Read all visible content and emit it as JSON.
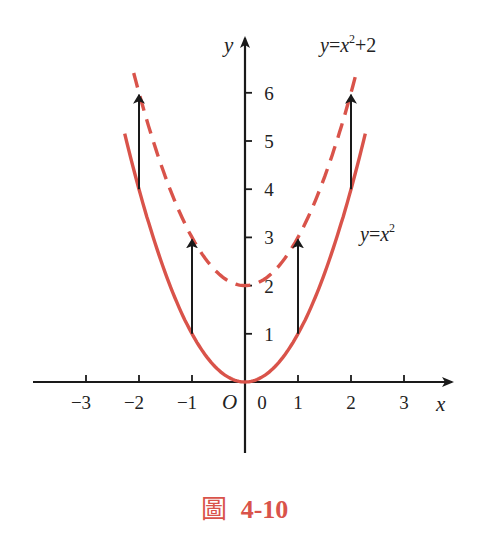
{
  "chart_data": {
    "type": "line",
    "title": "",
    "caption": {
      "prefix": "圖",
      "number": "4-10"
    },
    "xlabel": "x",
    "ylabel": "y",
    "origin_label": "O",
    "xlim": [
      -3.8,
      3.8
    ],
    "ylim": [
      -1.5,
      7
    ],
    "grid": false,
    "x_ticks": [
      -3,
      -2,
      -1,
      0,
      1,
      2,
      3
    ],
    "x_tick_labels": [
      "−3",
      "−2",
      "−1",
      "0",
      "1",
      "2",
      "3"
    ],
    "y_ticks": [
      1,
      2,
      3,
      4,
      5,
      6
    ],
    "y_tick_labels": [
      "1",
      "2",
      "3",
      "4",
      "5",
      "6"
    ],
    "series": [
      {
        "name": "y=x²",
        "label_parts": {
          "y": "y",
          "eq": "=",
          "x": "x",
          "sup": "2"
        },
        "style": "solid",
        "color": "#D9534A",
        "formula": "x^2",
        "x_range": [
          -2.27,
          2.27
        ],
        "x": [
          -2,
          -1,
          0,
          1,
          2
        ],
        "values": [
          4,
          1,
          0,
          1,
          4
        ]
      },
      {
        "name": "y=x²+2",
        "label_parts": {
          "y": "y",
          "eq": "=",
          "x": "x",
          "sup": "2",
          "tail": "+2"
        },
        "style": "dashed",
        "color": "#D9534A",
        "formula": "x^2+2",
        "x_range": [
          -2.1,
          2.1
        ],
        "x": [
          -2,
          -1,
          0,
          1,
          2
        ],
        "values": [
          6,
          3,
          2,
          3,
          6
        ]
      }
    ],
    "annotations": {
      "arrows": [
        {
          "x": -2,
          "from": 4,
          "to": 6
        },
        {
          "x": -1,
          "from": 1,
          "to": 3
        },
        {
          "x": 1,
          "from": 1,
          "to": 3
        },
        {
          "x": 2,
          "from": 4,
          "to": 6
        }
      ],
      "description": "Vertical upward arrows showing y=x² shifted up by 2 units"
    }
  },
  "caption": {
    "prefix": "圖",
    "number": "4-10"
  },
  "colors": {
    "curve": "#D9534A",
    "axis": "#1a1a1a",
    "caption": "#D9534A"
  }
}
